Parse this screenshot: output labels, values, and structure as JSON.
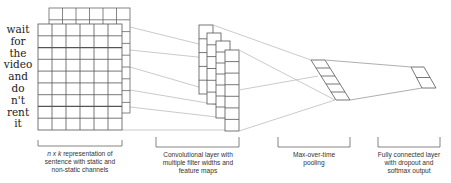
{
  "diagram": {
    "input": {
      "words": [
        "wait",
        "for",
        "the",
        "video",
        "and",
        "do",
        "n't",
        "rent",
        "it"
      ],
      "grid": {
        "rows": 9,
        "cols": 6
      },
      "channels": 2
    },
    "conv": {
      "feature_maps": [
        {
          "x": 199,
          "top": 25,
          "bottom": 94,
          "cells": 5
        },
        {
          "x": 207,
          "top": 33,
          "bottom": 104,
          "cells": 6
        },
        {
          "x": 216,
          "top": 41,
          "bottom": 118,
          "cells": 7
        },
        {
          "x": 225,
          "top": 50,
          "bottom": 131,
          "cells": 7
        }
      ]
    },
    "pooling": {
      "cells": 5
    },
    "output": {
      "cells": 2
    },
    "captions": {
      "input_ital": "n x k",
      "input_rest_line1": " representation of",
      "input_line2": "sentence with static and",
      "input_line3": "non-static channels",
      "conv_line1": "Convolutional layer with",
      "conv_line2": "multiple filter widths and",
      "conv_line3": "feature maps",
      "pool_line1": "Max-over-time",
      "pool_line2": "pooling",
      "fc_line1": "Fully connected layer",
      "fc_line2": "with dropout and",
      "fc_line3": "softmax output"
    },
    "colors": {
      "grid": "#555555",
      "connector": "#b5b5b5",
      "text": "#333333"
    }
  }
}
